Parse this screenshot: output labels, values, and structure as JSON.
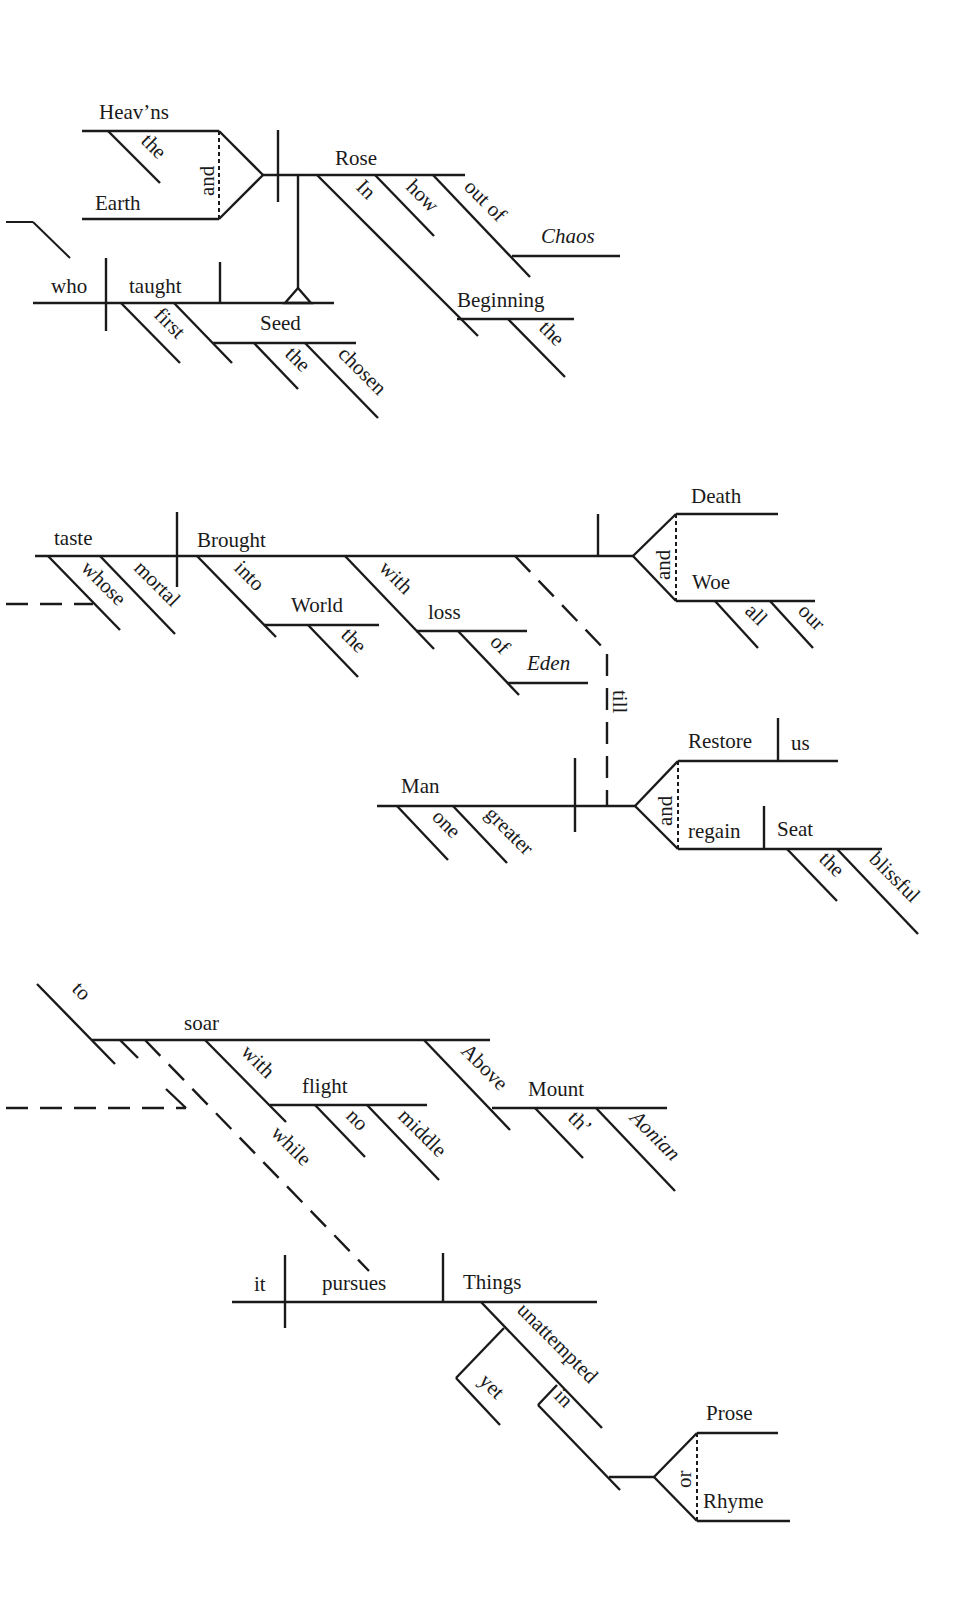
{
  "diagram": {
    "type": "Reed-Kellogg sentence diagram",
    "sections": [
      {
        "id": "clause-1",
        "words": {
          "heavns": "Heav’ns",
          "heavns_the": "the",
          "earth": "Earth",
          "conj_and": "and",
          "rose": "Rose",
          "in": "In",
          "how": "how",
          "out_of": "out of",
          "chaos": "Chaos",
          "beginning": "Beginning",
          "beginning_the": "the",
          "who": "who",
          "taught": "taught",
          "first": "first",
          "seed": "Seed",
          "seed_the": "the",
          "chosen": "chosen"
        }
      },
      {
        "id": "clause-2",
        "words": {
          "taste": "taste",
          "whose": "whose",
          "mortal": "mortal",
          "brought": "Brought",
          "into": "into",
          "world": "World",
          "world_the": "the",
          "with": "with",
          "loss": "loss",
          "of": "of",
          "eden": "Eden",
          "death": "Death",
          "conj_and": "and",
          "woe": "Woe",
          "all": "all",
          "our": "our",
          "till": "till",
          "man": "Man",
          "one": "one",
          "greater": "greater",
          "restore": "Restore",
          "us": "us",
          "conj_and2": "and",
          "regain": "regain",
          "seat": "Seat",
          "seat_the": "the",
          "blissful": "blissful"
        }
      },
      {
        "id": "clause-3",
        "words": {
          "to": "to",
          "soar": "soar",
          "with": "with",
          "flight": "flight",
          "no": "no",
          "middle": "middle",
          "above": "Above",
          "mount": "Mount",
          "th": "th’",
          "aonian": "Aonian",
          "while": "while",
          "it": "it",
          "pursues": "pursues",
          "things": "Things",
          "unattempted": "unattempted",
          "yet": "yet",
          "in": "in",
          "prose": "Prose",
          "conj_or": "or",
          "rhyme": "Rhyme"
        }
      }
    ]
  }
}
